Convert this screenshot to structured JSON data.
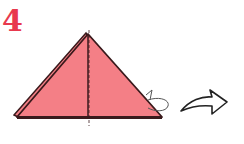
{
  "step": {
    "number": "4"
  },
  "colors": {
    "step_number": "#e8394e",
    "paper_fill": "#f47f86",
    "outline": "#3a1a1c",
    "arrow_stroke": "#222222"
  },
  "diagram": {
    "shape": "triangle",
    "fold_line": "dashed-vertical-center",
    "valley_fold_indicator": "curved-arrow-back",
    "next_step_arrow": "right-curved-arrow"
  }
}
